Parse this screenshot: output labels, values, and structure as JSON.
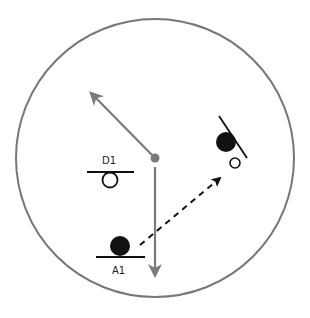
{
  "diagram": {
    "title": "",
    "colors": {
      "outline": "#777777",
      "arrow_gray": "#7a7a7a",
      "ink": "#111111",
      "background": "#ffffff"
    },
    "field": {
      "cx": 155,
      "cy": 158,
      "r": 139
    },
    "center_point": {
      "x": 155,
      "y": 158
    },
    "labels": {
      "d1": "D1",
      "a1": "A1"
    },
    "players": [
      {
        "id": "D1",
        "label": "D1",
        "x": 110,
        "y": 185,
        "fill": "open",
        "base": "horizontal"
      },
      {
        "id": "A1",
        "label": "A1",
        "x": 120,
        "y": 246,
        "fill": "solid",
        "base": "horizontal"
      },
      {
        "id": "right-solid",
        "label": "",
        "x": 226,
        "y": 142,
        "fill": "solid",
        "base": "diagonal"
      },
      {
        "id": "right-open",
        "label": "",
        "x": 235,
        "y": 162,
        "fill": "open",
        "base": "none"
      }
    ],
    "arrows": [
      {
        "id": "up-left-arrow",
        "from": [
          155,
          158
        ],
        "to": [
          88,
          90
        ],
        "style": "solid-gray"
      },
      {
        "id": "down-arrow",
        "from": [
          155,
          167
        ],
        "to": [
          155,
          277
        ],
        "style": "solid-gray"
      },
      {
        "id": "pass-arrow",
        "from": [
          140,
          245
        ],
        "to": [
          222,
          176
        ],
        "style": "dashed-black"
      }
    ]
  }
}
